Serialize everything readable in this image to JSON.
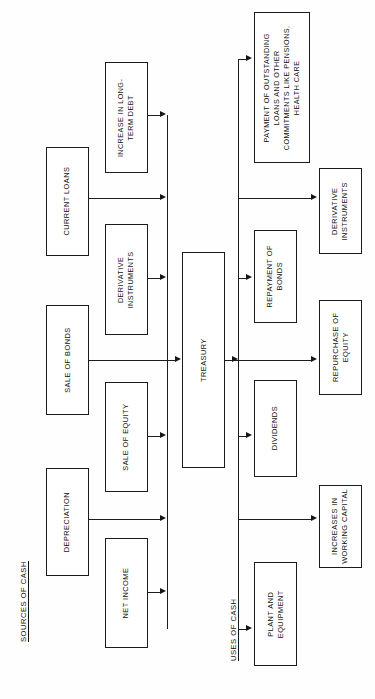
{
  "diagram": {
    "captions": {
      "sources": "SOURCES OF CASH",
      "uses": "USES OF CASH"
    },
    "hub": {
      "label": "TREASURY"
    },
    "sources_outer": [
      {
        "id": "current-loans",
        "label": "CURRENT LOANS"
      },
      {
        "id": "sale-of-bonds",
        "label": "SALE OF BONDS"
      },
      {
        "id": "depreciation",
        "label": "DEPRECIATION"
      }
    ],
    "sources_inner": [
      {
        "id": "increase-in-long-term-debt",
        "label": "INCREASE IN LONG-\nTERM DEBT"
      },
      {
        "id": "derivative-instruments-source",
        "label": "DERIVATIVE\nINSTRUMENTS"
      },
      {
        "id": "sale-of-equity",
        "label": "SALE OF EQUITY"
      },
      {
        "id": "net-income",
        "label": "NET INCOME"
      }
    ],
    "uses_inner": [
      {
        "id": "payment-of-outstanding-loans",
        "label": "PAYMENT OF OUTSTANDING\nLOANS AND OTHER\nCOMMITMENTS LIKE PENSIONS,\nHEALTH CARE"
      },
      {
        "id": "repayment-of-bonds",
        "label": "REPAYMENT OF\nBONDS"
      },
      {
        "id": "dividends",
        "label": "DIVIDENDS"
      },
      {
        "id": "plant-and-equipment",
        "label": "PLANT AND\nEQUIPMENT"
      }
    ],
    "uses_outer": [
      {
        "id": "derivative-instruments-use",
        "label": "DERIVATIVE\nINSTRUMENTS"
      },
      {
        "id": "repurchase-of-equity",
        "label": "REPURCHASE OF\nEQUITY"
      },
      {
        "id": "increases-in-working-capital",
        "label": "INCREASES IN\nWORKING CAPITAL"
      }
    ],
    "colors": {
      "background": "#fefefe",
      "box_border": "#1b1b1b",
      "line": "#1d1d1d",
      "text": "#111111"
    }
  }
}
